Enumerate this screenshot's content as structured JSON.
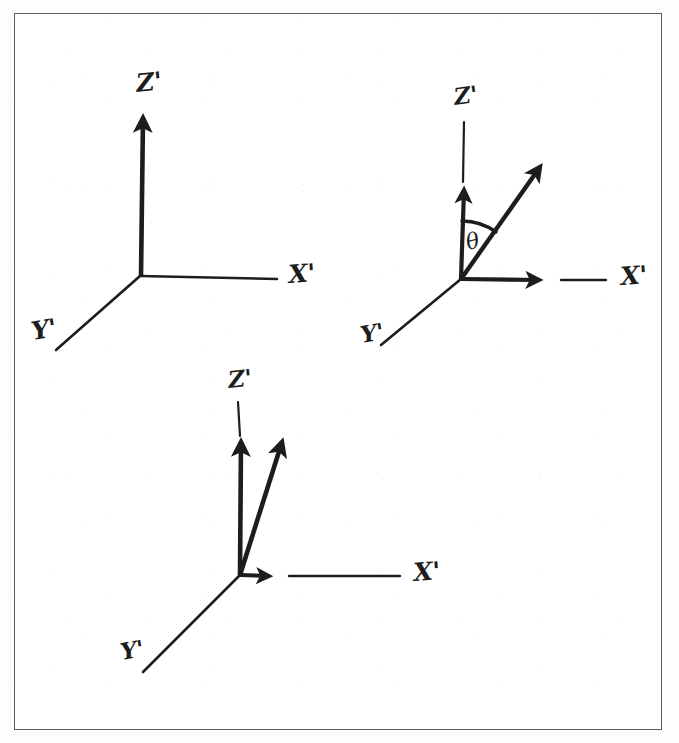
{
  "figure": {
    "kind": "hand-drawn-coordinate-axes",
    "ink_color": "#1d1d1d",
    "frame_color": "#5b5f63",
    "background_color": "#ffffff"
  },
  "diagrams": [
    {
      "id": "panel-a",
      "position": "top-left",
      "origin": [
        140,
        276
      ],
      "labels": {
        "x_axis": "X'",
        "y_axis": "Y'",
        "z_axis": "Z'"
      },
      "axes": [
        {
          "name": "z-prime-axis",
          "from": [
            140,
            276
          ],
          "to": [
            143,
            110
          ],
          "style": "bold",
          "arrowhead": true
        },
        {
          "name": "x-prime-axis",
          "from": [
            140,
            276
          ],
          "to": [
            277,
            279
          ],
          "style": "thin",
          "arrowhead": false
        },
        {
          "name": "y-prime-axis",
          "from": [
            140,
            276
          ],
          "to": [
            56,
            350
          ],
          "style": "thin",
          "arrowhead": false
        }
      ],
      "vectors": [],
      "angle_arc": null
    },
    {
      "id": "panel-b",
      "position": "top-right",
      "origin": [
        461,
        279
      ],
      "labels": {
        "x_axis": "X'",
        "y_axis": "Y'",
        "z_axis": "Z'",
        "angle": "θ"
      },
      "axes": [
        {
          "name": "z-prime-axis",
          "from": [
            461,
            279
          ],
          "to": [
            464,
            120
          ],
          "style": "thin",
          "arrowhead": false
        },
        {
          "name": "x-prime-axis",
          "from": [
            461,
            279
          ],
          "to": [
            606,
            280
          ],
          "style": "thin",
          "arrowhead": false
        },
        {
          "name": "y-prime-axis",
          "from": [
            461,
            279
          ],
          "to": [
            381,
            345
          ],
          "style": "thin",
          "arrowhead": false
        }
      ],
      "vectors": [
        {
          "name": "z-prime-unit-vector",
          "from": [
            461,
            279
          ],
          "to": [
            465,
            180
          ],
          "style": "bold",
          "arrowhead": true
        },
        {
          "name": "rotated-vector",
          "from": [
            461,
            279
          ],
          "to": [
            547,
            157
          ],
          "style": "bold",
          "arrowhead": true
        },
        {
          "name": "x-prime-unit-vector",
          "from": [
            461,
            279
          ],
          "to": [
            547,
            280
          ],
          "style": "bold",
          "arrowhead": true
        }
      ],
      "angle_arc": {
        "name": "theta-arc",
        "center": [
          461,
          279
        ],
        "radius": 58,
        "from_deg": 90,
        "to_deg": 55,
        "label": "θ",
        "label_position": [
          472,
          243
        ]
      }
    },
    {
      "id": "panel-c",
      "position": "bottom-center",
      "origin": [
        240,
        575
      ],
      "labels": {
        "x_axis": "X'",
        "y_axis": "Y'",
        "z_axis": "Z'"
      },
      "axes": [
        {
          "name": "z-prime-axis",
          "from": [
            240,
            575
          ],
          "to": [
            238,
            400
          ],
          "style": "thin",
          "arrowhead": false
        },
        {
          "name": "x-prime-axis",
          "from": [
            240,
            575
          ],
          "to": [
            400,
            576
          ],
          "style": "thin",
          "arrowhead": false
        },
        {
          "name": "y-prime-axis",
          "from": [
            240,
            575
          ],
          "to": [
            143,
            672
          ],
          "style": "thin",
          "arrowhead": false
        }
      ],
      "vectors": [
        {
          "name": "z-prime-unit-vector",
          "from": [
            240,
            575
          ],
          "to": [
            241,
            432
          ],
          "style": "bold",
          "arrowhead": true
        },
        {
          "name": "rotated-vector",
          "from": [
            240,
            575
          ],
          "to": [
            286,
            430
          ],
          "style": "bold",
          "arrowhead": true
        },
        {
          "name": "x-prime-unit-vector",
          "from": [
            240,
            575
          ],
          "to": [
            278,
            576
          ],
          "style": "bold",
          "arrowhead": true
        }
      ],
      "angle_arc": null
    }
  ],
  "label_placements": [
    {
      "id": "a-z",
      "diagram": "panel-a",
      "text": "Z'",
      "x": 137,
      "y": 92,
      "size": 25,
      "rotate": -6
    },
    {
      "id": "a-x",
      "diagram": "panel-a",
      "text": "X'",
      "x": 289,
      "y": 283,
      "size": 25,
      "rotate": -4
    },
    {
      "id": "a-y",
      "diagram": "panel-a",
      "text": "Y'",
      "x": 33,
      "y": 340,
      "size": 25,
      "rotate": -10
    },
    {
      "id": "b-z",
      "diagram": "panel-b",
      "text": "Z'",
      "x": 455,
      "y": 105,
      "size": 23,
      "rotate": -8
    },
    {
      "id": "b-x",
      "diagram": "panel-b",
      "text": "X'",
      "x": 621,
      "y": 285,
      "size": 25,
      "rotate": -4
    },
    {
      "id": "b-y",
      "diagram": "panel-b",
      "text": "Y'",
      "x": 362,
      "y": 343,
      "size": 23,
      "rotate": -10
    },
    {
      "id": "b-theta",
      "diagram": "panel-b",
      "text": "θ",
      "x": 468,
      "y": 250,
      "size": 22,
      "rotate": -14
    },
    {
      "id": "c-z",
      "diagram": "panel-c",
      "text": "Z'",
      "x": 229,
      "y": 388,
      "size": 23,
      "rotate": -6
    },
    {
      "id": "c-x",
      "diagram": "panel-c",
      "text": "X'",
      "x": 414,
      "y": 581,
      "size": 25,
      "rotate": -4
    },
    {
      "id": "c-y",
      "diagram": "panel-c",
      "text": "Y'",
      "x": 122,
      "y": 660,
      "size": 23,
      "rotate": -10
    }
  ]
}
